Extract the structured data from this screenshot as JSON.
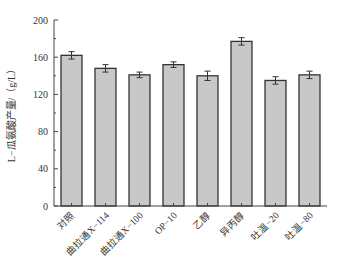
{
  "chart_data": {
    "type": "bar",
    "title": "",
    "xlabel": "",
    "ylabel": "L−瓜氨酸产量/（g/L）",
    "ylim": [
      0,
      200
    ],
    "yticks": [
      0,
      40,
      80,
      120,
      160,
      200
    ],
    "grid": false,
    "legend": null,
    "categories": [
      "对照",
      "曲拉通X−114",
      "曲拉通X−100",
      "OP−10",
      "乙醇",
      "异丙醇",
      "吐温−20",
      "吐温−80"
    ],
    "values": [
      162,
      148,
      141,
      152,
      140,
      177,
      135,
      141
    ],
    "errors": [
      4,
      4,
      3,
      3,
      5,
      4,
      4,
      4
    ],
    "bar_color": "#c8c8c8",
    "edge_color": "#333333"
  }
}
